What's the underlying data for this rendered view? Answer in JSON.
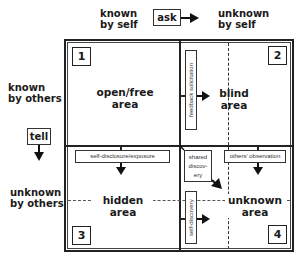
{
  "header": {
    "known_by_self": [
      "known",
      "by self"
    ],
    "ask": "ask",
    "unknown_by_self": [
      "unknown",
      "by self"
    ]
  },
  "side": {
    "known_by_others": [
      "known",
      "by others"
    ],
    "tell": "tell",
    "unknown_by_others": [
      "unknown",
      "by others"
    ]
  },
  "quadrants": [
    {
      "number": "1",
      "label": [
        "open/free",
        "area"
      ]
    },
    {
      "number": "2",
      "label": [
        "blind",
        "area"
      ]
    },
    {
      "number": "3",
      "label": [
        "hidden",
        "area"
      ]
    },
    {
      "number": "4",
      "label": [
        "unknown",
        "area"
      ]
    }
  ],
  "processes": {
    "feedback": "feedback solicitation",
    "self_disclosure": "self-disclosure/exposure",
    "shared_discovery": [
      "shared",
      "discov-",
      "ery"
    ],
    "others_observation": "others' observation",
    "self_discovery": "self-discovery"
  }
}
